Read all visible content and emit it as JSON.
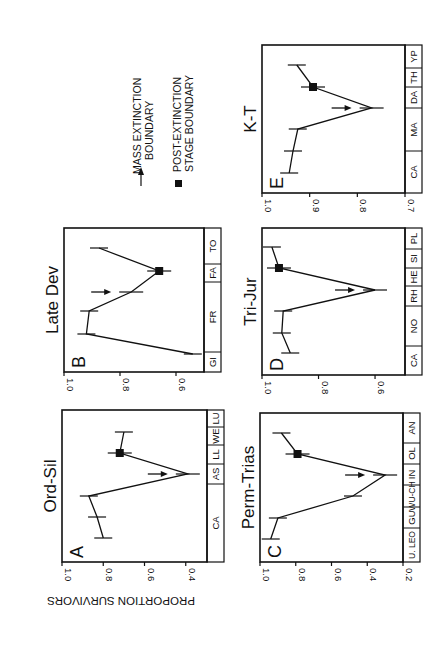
{
  "figure": {
    "ylabel": "PROPORTION SURVIVORS",
    "orientation": "rotated-90-cw",
    "legend": {
      "arrow_label_line1": "MASS EXTINCTION",
      "arrow_label_line2": "BOUNDARY",
      "square_label_line1": "POST-EXTINCTION",
      "square_label_line2": "STAGE BOUNDARY"
    }
  },
  "chart_data": [
    {
      "type": "line",
      "panel": "A",
      "title": "Ord-Sil",
      "ylabel": "PROPORTION SURVIVORS",
      "ylim": [
        1.0,
        0.3
      ],
      "yticks": [
        "1.0",
        "0.8",
        "0.6",
        "0.4"
      ],
      "stages": [
        "CA",
        "AS",
        "LL",
        "WE",
        "LU"
      ],
      "stage_bounds": [
        562,
        484,
        464,
        445,
        427,
        410
      ],
      "values": [
        0.8,
        0.83,
        0.87,
        0.39,
        0.72,
        0.7
      ],
      "point_y": [
        538,
        517,
        496,
        474,
        453,
        432
      ],
      "arrow_index": 3,
      "square_index": 4,
      "frame": {
        "x0": 62,
        "x1": 207,
        "y0": 410,
        "y1": 562,
        "v0": 1.0,
        "v1": 0.297
      },
      "band_width": 17
    },
    {
      "type": "line",
      "panel": "B",
      "title": "Late Dev",
      "ylim": [
        1.0,
        0.5
      ],
      "yticks": [
        "1.0",
        "0.8",
        "0.6"
      ],
      "stages": [
        "GI",
        "FR",
        "FA",
        "TO"
      ],
      "stage_bounds": [
        372,
        352,
        282,
        264,
        228
      ],
      "values": [
        0.54,
        0.92,
        0.91,
        0.76,
        0.66,
        0.875
      ],
      "point_y": [
        354,
        334,
        311,
        292,
        271,
        248
      ],
      "arrow_index": 3,
      "square_index": 4,
      "frame": {
        "x0": 64,
        "x1": 204,
        "y0": 228,
        "y1": 372,
        "v0": 1.0,
        "v1": 0.5
      },
      "band_width": 17
    },
    {
      "type": "line",
      "panel": "C",
      "title": "Perm-Trias",
      "ylim": [
        1.0,
        0.2
      ],
      "yticks": [
        "1.0",
        "0.8",
        "0.6",
        "0.4",
        "0.2"
      ],
      "stages": [
        "U. LEO",
        "GU",
        "WU-CH",
        "IN",
        "OL",
        "AN"
      ],
      "stage_bounds": [
        562,
        528,
        507,
        485,
        464,
        443,
        413
      ],
      "values": [
        0.94,
        0.9,
        0.48,
        0.3,
        0.79,
        0.88
      ],
      "point_y": [
        539,
        518,
        496,
        475,
        454,
        433
      ],
      "arrow_index": 3,
      "square_index": 4,
      "frame": {
        "x0": 260,
        "x1": 403,
        "y0": 413,
        "y1": 562,
        "v0": 1.0,
        "v1": 0.2
      },
      "band_width": 17
    },
    {
      "type": "line",
      "panel": "D",
      "title": "Tri-Jur",
      "ylim": [
        1.0,
        0.5
      ],
      "yticks": [
        "1.0",
        "0.8",
        "0.6"
      ],
      "stages": [
        "CA",
        "NO",
        "RH",
        "HE",
        "SI",
        "PL"
      ],
      "stage_bounds": [
        375,
        346,
        306,
        286,
        268,
        249,
        228
      ],
      "values": [
        0.9,
        0.93,
        0.925,
        0.6,
        0.94,
        0.965
      ],
      "point_y": [
        353,
        333,
        311,
        290,
        268,
        247
      ],
      "arrow_index": 3,
      "square_index": 4,
      "frame": {
        "x0": 262,
        "x1": 405,
        "y0": 228,
        "y1": 375,
        "v0": 1.0,
        "v1": 0.494
      },
      "band_width": 17
    },
    {
      "type": "line",
      "panel": "E",
      "title": "K-T",
      "ylim": [
        1.0,
        0.7
      ],
      "yticks": [
        "1.0",
        "0.9",
        "0.8",
        "0.7"
      ],
      "stages": [
        "CA",
        "MA",
        "DA",
        "TH",
        "YP"
      ],
      "stage_bounds": [
        193,
        151,
        108,
        87,
        68,
        45
      ],
      "values": [
        0.943,
        0.935,
        0.925,
        0.77,
        0.893,
        0.927
      ],
      "point_y": [
        173,
        151,
        129,
        108,
        87,
        65
      ],
      "arrow_index": 3,
      "square_index": 4,
      "frame": {
        "x0": 262,
        "x1": 405,
        "y0": 45,
        "y1": 193,
        "v0": 1.0,
        "v1": 0.7
      },
      "band_width": 17
    }
  ]
}
